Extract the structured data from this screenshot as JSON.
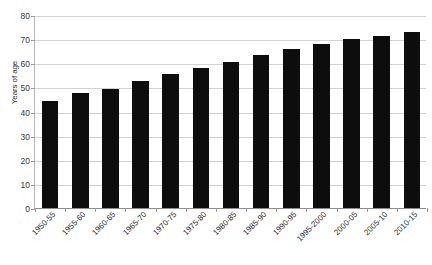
{
  "chart_data": {
    "type": "bar",
    "title": "",
    "subtitle": "",
    "xlabel": "",
    "ylabel": "Years of age",
    "ylim": [
      0,
      80
    ],
    "ytick_step": 10,
    "yticks": [
      0,
      10,
      20,
      30,
      40,
      50,
      60,
      70,
      80
    ],
    "grid": true,
    "legend": false,
    "legend_position": "none",
    "bar_color": "#0d0d0d",
    "gridline_color": "#d2d2d2",
    "axis_color": "#8d8d8d",
    "categories": [
      "1950-55",
      "1955-60",
      "1960-65",
      "1965-70",
      "1970-75",
      "1975-80",
      "1980-85",
      "1985-90",
      "1990-95",
      "1995-2000",
      "2000-05",
      "2005-10",
      "2010-15"
    ],
    "values": [
      44.5,
      47.5,
      49.5,
      52.5,
      55.5,
      58.0,
      60.5,
      63.5,
      66.0,
      68.0,
      70.0,
      71.5,
      73.0
    ],
    "series": [
      {
        "name": "Life expectancy",
        "values": [
          44.5,
          47.5,
          49.5,
          52.5,
          55.5,
          58.0,
          60.5,
          63.5,
          66.0,
          68.0,
          70.0,
          71.5,
          73.0
        ]
      }
    ]
  }
}
